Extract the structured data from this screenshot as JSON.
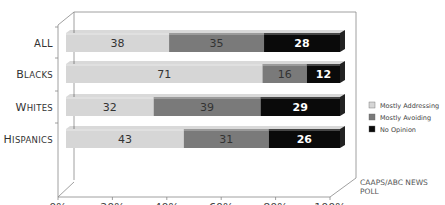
{
  "chart_data": {
    "type": "bar",
    "orientation": "horizontal",
    "stacked": "percent",
    "categories": [
      "ALL",
      "BLACKS",
      "WHITES",
      "HISPANICS"
    ],
    "series": [
      {
        "name": "Mostly Addressing",
        "color": "#d6d6d6",
        "values": [
          38,
          71,
          32,
          43
        ]
      },
      {
        "name": "Mostly Avoiding",
        "color": "#7a7a7a",
        "values": [
          35,
          16,
          39,
          31
        ]
      },
      {
        "name": "No Opinion",
        "color": "#0a0a0a",
        "values": [
          28,
          12,
          29,
          26
        ]
      }
    ],
    "xticks": [
      "0%",
      "20%",
      "40%",
      "60%",
      "80%",
      "100%"
    ],
    "xlim": [
      0,
      100
    ],
    "title": "",
    "xlabel": "",
    "ylabel": "",
    "legend_position": "right",
    "source": "CAAPS/ABC NEWS POLL"
  },
  "labels": {
    "categories": [
      "ALL",
      "Blacks",
      "Whites",
      "Hispanics"
    ],
    "ticks": [
      "0%",
      "20%",
      "40%",
      "60%",
      "80%",
      "100%"
    ],
    "legend": [
      "Mostly Addressing",
      "Mostly Avoiding",
      "No Opinion"
    ],
    "source_line1": "CAAPS/ABC NEWS",
    "source_line2": "POLL"
  }
}
